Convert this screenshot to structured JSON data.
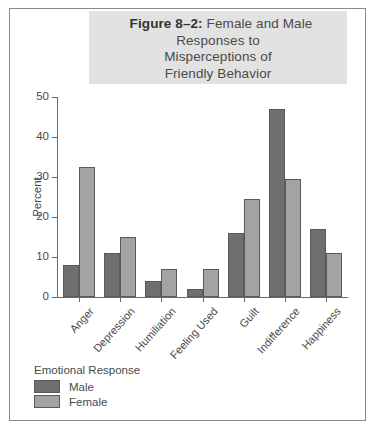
{
  "figure": {
    "label": "Figure 8–2:",
    "title_lines": [
      "Female and Male",
      "Responses to",
      "Misperceptions of",
      "Friendly Behavior"
    ],
    "title_full": "Figure 8–2: Female and Male Responses to Misperceptions of Friendly Behavior"
  },
  "legend": {
    "title": "Emotional Response",
    "entries": [
      {
        "label": "Male",
        "color": "#6f6f6f"
      },
      {
        "label": "Female",
        "color": "#a3a3a3"
      }
    ]
  },
  "chart_data": {
    "type": "bar",
    "title": "Figure 8–2: Female and Male Responses to Misperceptions of Friendly Behavior",
    "xlabel": "",
    "ylabel": "Percent",
    "ylim": [
      0,
      50
    ],
    "yticks": [
      0,
      10,
      20,
      30,
      40,
      50
    ],
    "grid": false,
    "legend_position": "below-left",
    "legend_title": "Emotional Response",
    "categories": [
      "Anger",
      "Depression",
      "Humiliation",
      "Feeling Used",
      "Guilt",
      "Indifference",
      "Happiness"
    ],
    "series": [
      {
        "name": "Male",
        "color": "#6f6f6f",
        "values": [
          8,
          11,
          4,
          2,
          16,
          47,
          17
        ]
      },
      {
        "name": "Female",
        "color": "#a3a3a3",
        "values": [
          32.5,
          15,
          7,
          7,
          24.5,
          29.5,
          11
        ]
      }
    ]
  }
}
